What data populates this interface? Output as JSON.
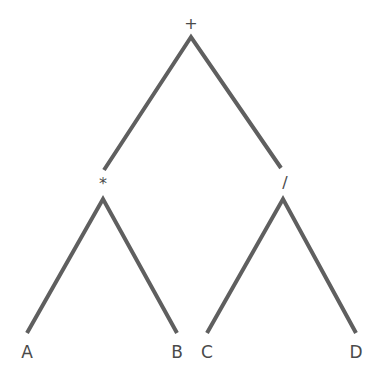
{
  "diagram": {
    "type": "expression-tree",
    "edge_color": "#5f5f5f",
    "text_color": "#4a4a4a",
    "nodes": {
      "root": {
        "label": "+",
        "x": 191,
        "y": 24
      },
      "mul": {
        "label": "*",
        "x": 103,
        "y": 183
      },
      "div": {
        "label": "/",
        "x": 285,
        "y": 183
      },
      "a": {
        "label": "A",
        "x": 27,
        "y": 352
      },
      "b": {
        "label": "B",
        "x": 177,
        "y": 352
      },
      "c": {
        "label": "C",
        "x": 207,
        "y": 352
      },
      "d": {
        "label": "D",
        "x": 356,
        "y": 352
      }
    },
    "edges": [
      {
        "from": "root",
        "to": "mul"
      },
      {
        "from": "root",
        "to": "div"
      },
      {
        "from": "mul",
        "to": "a"
      },
      {
        "from": "mul",
        "to": "b"
      },
      {
        "from": "div",
        "to": "c"
      },
      {
        "from": "div",
        "to": "d"
      }
    ]
  }
}
